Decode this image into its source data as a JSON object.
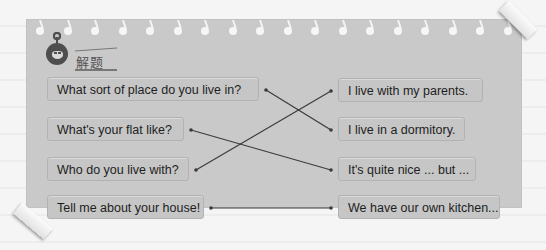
{
  "heading": "解题",
  "questions": [
    "What sort of place do you live in?",
    "What's your flat like?",
    "Who do you live with?",
    "Tell me about your house!"
  ],
  "answers": [
    "I live with my parents.",
    "I live in a dormitory.",
    "It's quite nice ... but ...",
    "We have our own kitchen..."
  ],
  "matches": [
    {
      "question": 1,
      "answer": 2
    },
    {
      "question": 2,
      "answer": 3
    },
    {
      "question": 3,
      "answer": 1
    },
    {
      "question": 4,
      "answer": 4
    }
  ],
  "colors": {
    "paper": "#c9c9c9",
    "line": "#3a3a3a",
    "text": "#1e1e1e",
    "mascot": "#4e4e4e"
  }
}
